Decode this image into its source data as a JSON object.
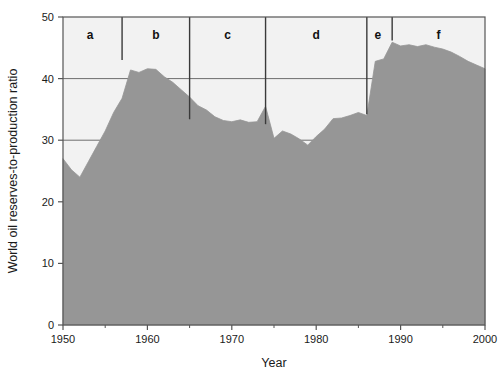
{
  "chart_data": {
    "type": "area",
    "title": "",
    "xlabel": "Year",
    "ylabel": "World oil reserves-to-production ratio",
    "xlim": [
      1950,
      2000
    ],
    "ylim": [
      0,
      50
    ],
    "grid": true,
    "legend": "none",
    "x_ticks_major": [
      1950,
      1960,
      1970,
      1980,
      1990,
      2000
    ],
    "x_ticks_minor": [
      1955,
      1965,
      1975,
      1985,
      1995
    ],
    "y_ticks": [
      0,
      10,
      20,
      30,
      40,
      50
    ],
    "series": [
      {
        "name": "World oil reserves-to-production ratio",
        "x": [
          1950,
          1951,
          1952,
          1953,
          1954,
          1955,
          1956,
          1957,
          1958,
          1959,
          1960,
          1961,
          1962,
          1963,
          1964,
          1965,
          1966,
          1967,
          1968,
          1969,
          1970,
          1971,
          1972,
          1973,
          1974,
          1975,
          1976,
          1977,
          1978,
          1979,
          1980,
          1981,
          1982,
          1983,
          1984,
          1985,
          1986,
          1987,
          1988,
          1989,
          1990,
          1991,
          1992,
          1993,
          1994,
          1995,
          1996,
          1997,
          1998,
          1999,
          2000
        ],
        "values": [
          27.0,
          25.2,
          24.0,
          26.5,
          29.0,
          31.5,
          34.5,
          36.8,
          41.4,
          41.0,
          41.6,
          41.5,
          40.3,
          39.4,
          38.2,
          37.0,
          35.6,
          34.9,
          33.8,
          33.2,
          33.0,
          33.3,
          32.9,
          33.0,
          35.5,
          30.3,
          31.5,
          31.0,
          30.2,
          29.2,
          30.6,
          31.8,
          33.5,
          33.6,
          34.0,
          34.5,
          34.0,
          42.8,
          43.2,
          45.9,
          45.3,
          45.5,
          45.2,
          45.5,
          45.1,
          44.8,
          44.3,
          43.6,
          42.8,
          42.2,
          41.6
        ]
      }
    ],
    "annotations": [
      {
        "label": "a",
        "x_start": 1950,
        "x_end": 1957,
        "label_x": 1953.2,
        "divider_x": 1957,
        "divider_top": 50.0,
        "divider_bottom": 43.0
      },
      {
        "label": "b",
        "x_start": 1957,
        "x_end": 1965,
        "label_x": 1961.0,
        "divider_x": 1965,
        "divider_top": 50.0,
        "divider_bottom": 33.4
      },
      {
        "label": "c",
        "x_start": 1965,
        "x_end": 1974,
        "label_x": 1969.5,
        "divider_x": 1974,
        "divider_top": 50.0,
        "divider_bottom": 32.6
      },
      {
        "label": "d",
        "x_start": 1974,
        "x_end": 1986,
        "label_x": 1980.0,
        "divider_x": 1986,
        "divider_top": 50.0,
        "divider_bottom": 34.2
      },
      {
        "label": "e",
        "x_start": 1986,
        "x_end": 1989,
        "label_x": 1987.3,
        "divider_x": 1989,
        "divider_top": 50.0,
        "divider_bottom": 46.2
      },
      {
        "label": "f",
        "x_start": 1989,
        "x_end": 2000,
        "label_x": 1994.5,
        "divider_x": null,
        "divider_top": null,
        "divider_bottom": null
      }
    ],
    "colors": {
      "area_fill": "#969696",
      "plot_background": "#f2f2f2",
      "gridline": "#6e6e6e",
      "frame": "#555555",
      "divider": "#3a3a3a",
      "text": "#1a1a1a",
      "page_background": "#ffffff"
    }
  }
}
